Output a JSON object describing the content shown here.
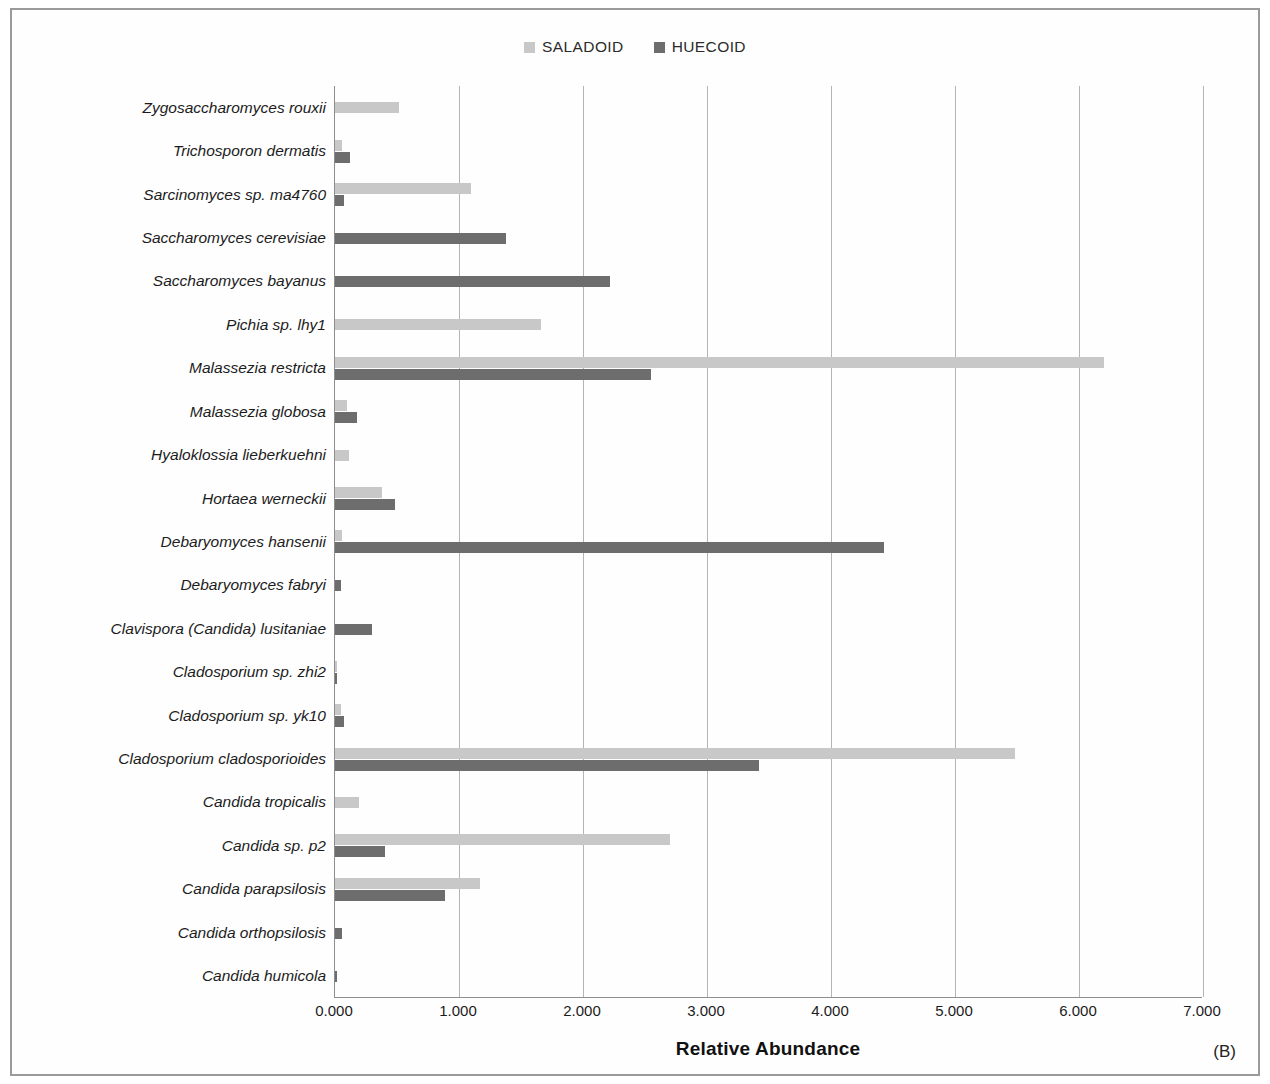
{
  "figure": {
    "panel_tag": "(B)",
    "xaxis_title": "Relative Abundance",
    "colors": {
      "saladoid": "#c8c8c8",
      "huecoid": "#6d6d6d",
      "grid": "#b4b4b4",
      "axis": "#8e8e8e"
    }
  },
  "legend": {
    "items": [
      {
        "label": "SALADOID",
        "color": "#c8c8c8"
      },
      {
        "label": "HUECOID",
        "color": "#6d6d6d"
      }
    ]
  },
  "chart_data": {
    "type": "bar",
    "orientation": "horizontal",
    "title": "",
    "subtitle": "",
    "xlabel": "Relative Abundance",
    "ylabel": "",
    "xlim": [
      0,
      7
    ],
    "xticks": [
      "0.000",
      "1.000",
      "2.000",
      "3.000",
      "4.000",
      "5.000",
      "6.000",
      "7.000"
    ],
    "xtick_values": [
      0,
      1,
      2,
      3,
      4,
      5,
      6,
      7
    ],
    "grid": "vertical",
    "legend_position": "top-center",
    "categories": [
      "Zygosaccharomyces rouxii",
      "Trichosporon dermatis",
      "Sarcinomyces sp. ma4760",
      "Saccharomyces cerevisiae",
      "Saccharomyces bayanus",
      "Pichia sp. lhy1",
      "Malassezia restricta",
      "Malassezia globosa",
      "Hyaloklossia lieberkuehni",
      "Hortaea werneckii",
      "Debaryomyces hansenii",
      "Debaryomyces fabryi",
      "Clavispora (Candida) lusitaniae",
      "Cladosporium sp. zhi2",
      "Cladosporium sp. yk10",
      "Cladosporium cladosporioides",
      "Candida tropicalis",
      "Candida sp. p2",
      "Candida parapsilosis",
      "Candida orthopsilosis",
      "Candida humicola"
    ],
    "series": [
      {
        "name": "SALADOID",
        "color": "#c8c8c8",
        "values": [
          0.52,
          0.06,
          1.1,
          0.0,
          0.0,
          1.66,
          6.2,
          0.1,
          0.11,
          0.38,
          0.06,
          0.0,
          0.0,
          0.02,
          0.05,
          5.48,
          0.19,
          2.7,
          1.17,
          0.0,
          0.0
        ]
      },
      {
        "name": "HUECOID",
        "color": "#6d6d6d",
        "values": [
          0.0,
          0.12,
          0.07,
          1.38,
          2.22,
          0.0,
          2.55,
          0.18,
          0.0,
          0.48,
          4.43,
          0.05,
          0.3,
          0.02,
          0.07,
          3.42,
          0.0,
          0.4,
          0.89,
          0.06,
          0.02
        ]
      }
    ]
  }
}
